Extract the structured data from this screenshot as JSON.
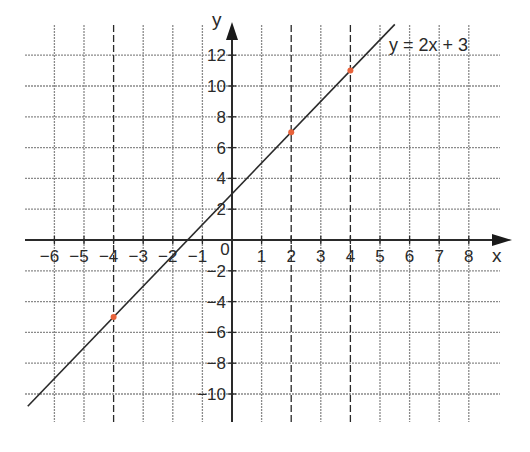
{
  "chart_data": {
    "type": "line",
    "title": "",
    "xlabel": "x",
    "ylabel": "y",
    "xlim": [
      -7,
      9
    ],
    "ylim": [
      -12,
      14
    ],
    "grid": true,
    "x_ticks": [
      -6,
      -5,
      -4,
      -3,
      -2,
      -1,
      0,
      1,
      2,
      3,
      4,
      5,
      6,
      7,
      8
    ],
    "x_tick_labels": [
      "−6",
      "−5",
      "−4",
      "−3",
      "−2",
      "−1",
      "0",
      "1",
      "2",
      "3",
      "4",
      "5",
      "6",
      "7",
      "8"
    ],
    "y_ticks": [
      12,
      10,
      8,
      6,
      4,
      2,
      -2,
      -4,
      -6,
      -8,
      -10
    ],
    "y_tick_labels": [
      "12",
      "10",
      "8",
      "6",
      "4",
      "2",
      "−2",
      "−4",
      "−6",
      "−8",
      "−10"
    ],
    "series": [
      {
        "name": "y = 2x + 3",
        "equation": "y = 2x + 3",
        "slope": 2,
        "intercept": 3,
        "x": [
          -6.9,
          5.5
        ],
        "y": [
          -10.8,
          14
        ],
        "color": "#2a2a2a"
      }
    ],
    "highlighted_points": [
      {
        "x": -4,
        "y": -5
      },
      {
        "x": 2,
        "y": 7
      },
      {
        "x": 4,
        "y": 11
      }
    ],
    "highlight_color": "#e8623a",
    "dashed_guides_x": [
      -4,
      2,
      4
    ],
    "annotations": [
      {
        "text": "y = 2x + 3",
        "near": {
          "x": 4.3,
          "y": 12.6
        }
      }
    ]
  },
  "labels": {
    "x_axis": "x",
    "y_axis": "y",
    "equation": "y = 2x + 3",
    "origin": "0"
  }
}
